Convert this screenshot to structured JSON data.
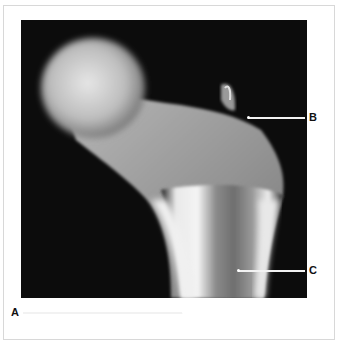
{
  "figure": {
    "labels": [
      {
        "id": "A",
        "text": "A"
      },
      {
        "id": "B",
        "text": "B"
      },
      {
        "id": "C",
        "text": "C"
      }
    ],
    "colors": {
      "background": "#ffffff",
      "frame_border": "#d8d8d8",
      "xray_background": "#0c0c0c",
      "bone_bright": "#f0f0f0",
      "leader_line": "#f2f2f2",
      "label_text": "#111111"
    }
  }
}
